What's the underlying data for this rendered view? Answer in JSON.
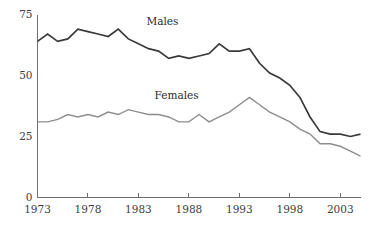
{
  "chart_data": {
    "type": "line",
    "title": "",
    "subtitle": "",
    "xlabel": "",
    "ylabel": "",
    "xlim": [
      1973,
      2005
    ],
    "ylim": [
      0,
      75
    ],
    "yticks": [
      0,
      25,
      50,
      75
    ],
    "ytick_labels": [
      "0",
      "25",
      "50",
      "75"
    ],
    "xticks": [
      1973,
      1978,
      1983,
      1988,
      1993,
      1998,
      2003
    ],
    "xtick_labels": [
      "1973",
      "1978",
      "1983",
      "1988",
      "1993",
      "1998",
      "2003"
    ],
    "grid": false,
    "legend_position": "inline-annotations",
    "x": [
      1973,
      1974,
      1975,
      1976,
      1977,
      1978,
      1979,
      1980,
      1981,
      1982,
      1983,
      1984,
      1985,
      1986,
      1987,
      1988,
      1989,
      1990,
      1991,
      1992,
      1993,
      1994,
      1995,
      1996,
      1997,
      1998,
      1999,
      2000,
      2001,
      2002,
      2003,
      2004,
      2005
    ],
    "series": [
      {
        "name": "Males",
        "color": "#3a3a3a",
        "label_text": "Males",
        "label_x": 1983.8,
        "label_y": 70.5,
        "values": [
          64,
          67,
          64,
          65,
          69,
          68,
          67,
          66,
          69,
          65,
          63,
          61,
          60,
          57,
          58,
          57,
          58,
          59,
          63,
          60,
          60,
          61,
          55,
          51,
          49,
          46,
          41,
          33,
          27,
          26,
          26,
          25,
          26
        ]
      },
      {
        "name": "Females",
        "color": "#8d8d8d",
        "label_text": "Females",
        "label_x": 1984.6,
        "label_y": 40.5,
        "values": [
          31,
          31,
          32,
          34,
          33,
          34,
          33,
          35,
          34,
          36,
          35,
          34,
          34,
          33,
          31,
          31,
          34,
          31,
          33,
          35,
          38,
          41,
          38,
          35,
          33,
          31,
          28,
          26,
          22,
          22,
          21,
          19,
          17
        ]
      }
    ]
  }
}
